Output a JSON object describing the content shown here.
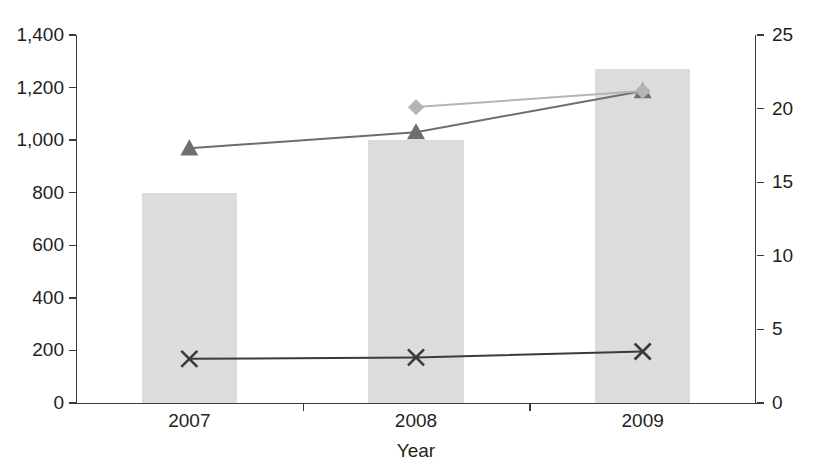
{
  "chart_data": {
    "type": "bar",
    "title": "",
    "xlabel": "Year",
    "ylabel": "",
    "categories": [
      "2007",
      "2008",
      "2009"
    ],
    "x_tick_labels": [
      "2007",
      "2008",
      "2009"
    ],
    "left_axis": {
      "ylim": [
        0,
        1400
      ],
      "tick_step": 200,
      "tick_labels": [
        "0",
        "200",
        "400",
        "600",
        "800",
        "1,000",
        "1,200",
        "1,400"
      ],
      "tick_values": [
        0,
        200,
        400,
        600,
        800,
        1000,
        1200,
        1400
      ]
    },
    "right_axis": {
      "ylim": [
        0,
        25
      ],
      "tick_step": 5,
      "tick_labels": [
        "0",
        "5",
        "10",
        "15",
        "20",
        "25"
      ],
      "tick_values": [
        0,
        5,
        10,
        15,
        20,
        25
      ]
    },
    "grid": false,
    "legend": "none",
    "series": [
      {
        "name": "bars",
        "kind": "bar",
        "axis": "left",
        "color": "#dcdcdc",
        "values": [
          800,
          1000,
          1270
        ]
      },
      {
        "name": "triangle-line",
        "kind": "line",
        "marker": "triangle",
        "axis": "right",
        "color": "#6e6e6e",
        "values": [
          17.3,
          18.4,
          21.2
        ]
      },
      {
        "name": "diamond-line",
        "kind": "line",
        "marker": "diamond",
        "axis": "right",
        "color": "#b4b4b4",
        "values": [
          null,
          20.1,
          21.2
        ]
      },
      {
        "name": "cross-line",
        "kind": "line",
        "marker": "x",
        "axis": "right",
        "color": "#3a3a3a",
        "values": [
          3.0,
          3.1,
          3.5
        ]
      }
    ]
  },
  "axis_titles": {
    "x": "Year"
  },
  "cropped_header": {
    "left_fragment": "",
    "note": ""
  }
}
